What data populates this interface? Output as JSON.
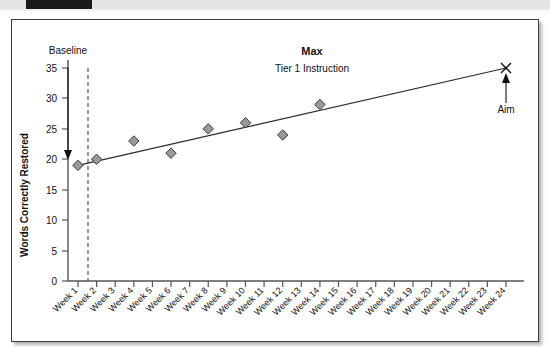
{
  "scan": {
    "strip_label": "",
    "black_block": ""
  },
  "chart_data": {
    "type": "scatter",
    "title": "Max",
    "subtitle": "Tier 1 Instruction",
    "xlabel": "",
    "ylabel": "Words Correctly Restored",
    "categories": [
      "Week 1",
      "Week 2",
      "Week 3",
      "Week 4",
      "Week 5",
      "Week 6",
      "Week 7",
      "Week 8",
      "Week 9",
      "Week 10",
      "Week 11",
      "Week 12",
      "Week 13",
      "Week 14",
      "Week 15",
      "Week 16",
      "Week 17",
      "Week 18",
      "Week 19",
      "Week 20",
      "Week 21",
      "Week 22",
      "Week 23",
      "Week 24"
    ],
    "ylim": [
      0,
      35
    ],
    "yticks": [
      0,
      5,
      10,
      15,
      20,
      25,
      30,
      35
    ],
    "grid": false,
    "legend": "none",
    "series": [
      {
        "name": "Words Correctly Restored",
        "marker": "diamond",
        "points": [
          {
            "x": "Week 1",
            "xi": 1,
            "y": 19
          },
          {
            "x": "Week 2",
            "xi": 2,
            "y": 20
          },
          {
            "x": "Week 4",
            "xi": 4,
            "y": 23
          },
          {
            "x": "Week 6",
            "xi": 6,
            "y": 21
          },
          {
            "x": "Week 8",
            "xi": 8,
            "y": 25
          },
          {
            "x": "Week 10",
            "xi": 10,
            "y": 26
          },
          {
            "x": "Week 12",
            "xi": 12,
            "y": 24
          },
          {
            "x": "Week 14",
            "xi": 14,
            "y": 29
          }
        ]
      },
      {
        "name": "Aim line",
        "marker": "line",
        "from": {
          "xi": 1,
          "y": 19
        },
        "to": {
          "xi": 24,
          "y": 35
        }
      },
      {
        "name": "Aim point",
        "marker": "x",
        "points": [
          {
            "x": "Week 24",
            "xi": 24,
            "y": 35
          }
        ]
      }
    ],
    "annotations": [
      {
        "name": "baseline",
        "label": "Baseline",
        "arrow": "down",
        "target_xi": 1,
        "target_y": 19
      },
      {
        "name": "aim",
        "label": "Aim",
        "arrow": "up",
        "target_xi": 24,
        "target_y": 35
      },
      {
        "name": "phase-line",
        "label": "",
        "style": "dashed-vertical",
        "at_xi": 1.5
      }
    ]
  }
}
